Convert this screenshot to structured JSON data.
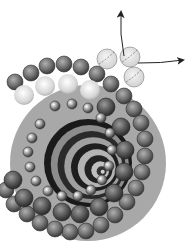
{
  "diagram": {
    "colors": {
      "background": "#ffffff",
      "shell_band": "#a8a8a8",
      "outer_sphere": "#6e6e6e",
      "light_sphere": "#d8d8d8",
      "inner_sphere": "#5a5a5a",
      "small_sphere": "#8a8a8a",
      "core_dark": "#1a1a1a",
      "core_light": "#9a9a9a",
      "arrow": "#222222",
      "glass_sphere": "#e2e2e2"
    },
    "center": {
      "x": 88,
      "y": 163
    },
    "outer_ring": [
      [
        15,
        82
      ],
      [
        31,
        73
      ],
      [
        47,
        66
      ],
      [
        64,
        64
      ],
      [
        81,
        67
      ],
      [
        97,
        74
      ],
      [
        111,
        84
      ],
      [
        124,
        96
      ],
      [
        134,
        109
      ],
      [
        141,
        123
      ],
      [
        145,
        139
      ],
      [
        145,
        156
      ],
      [
        142,
        172
      ],
      [
        136,
        188
      ],
      [
        127,
        202
      ],
      [
        115,
        215
      ],
      [
        101,
        225
      ],
      [
        86,
        231
      ],
      [
        70,
        232
      ],
      [
        55,
        229
      ],
      [
        40,
        223
      ],
      [
        27,
        214
      ],
      [
        14,
        204
      ],
      [
        6,
        190
      ]
    ],
    "light_ring": [
      [
        24,
        95
      ],
      [
        45,
        86
      ],
      [
        68,
        84
      ],
      [
        90,
        90
      ]
    ],
    "inner_ring": [
      [
        106,
        107
      ],
      [
        121,
        127
      ],
      [
        125,
        150
      ],
      [
        124,
        172
      ],
      [
        114,
        193
      ],
      [
        99,
        207
      ],
      [
        80,
        214
      ],
      [
        62,
        212
      ],
      [
        42,
        206
      ],
      [
        24,
        198
      ],
      [
        13,
        180
      ]
    ],
    "small_ring": [
      [
        55,
        106
      ],
      [
        72,
        104
      ],
      [
        88,
        108
      ],
      [
        101,
        118
      ],
      [
        110,
        133
      ],
      [
        112,
        150
      ],
      [
        109,
        166
      ],
      [
        102,
        180
      ],
      [
        91,
        190
      ],
      [
        78,
        196
      ],
      [
        62,
        196
      ],
      [
        48,
        191
      ],
      [
        36,
        181
      ],
      [
        30,
        167
      ],
      [
        28,
        152
      ],
      [
        32,
        138
      ],
      [
        40,
        124
      ]
    ],
    "glass_spheres": [
      [
        107,
        59
      ],
      [
        130,
        57
      ],
      [
        134,
        77
      ]
    ],
    "arrows": {
      "up": {
        "from": [
          124,
          56
        ],
        "to": [
          121,
          12
        ]
      },
      "right": {
        "from": [
          138,
          63
        ],
        "to": [
          183,
          60
        ]
      }
    },
    "spiral_rings": [
      {
        "r": 44,
        "fill": "#1a1a1a"
      },
      {
        "r": 39,
        "fill": "#8c8c8c"
      },
      {
        "r": 34,
        "fill": "#2a2a2a"
      },
      {
        "r": 29,
        "fill": "#a0a0a0"
      },
      {
        "r": 24,
        "fill": "#1e1e1e"
      },
      {
        "r": 19,
        "fill": "#b4b4b4"
      },
      {
        "r": 14,
        "fill": "#222222"
      },
      {
        "r": 9,
        "fill": "#c0c0c0"
      },
      {
        "r": 5,
        "fill": "#333333"
      },
      {
        "r": 2,
        "fill": "#d0d0d0"
      }
    ]
  }
}
